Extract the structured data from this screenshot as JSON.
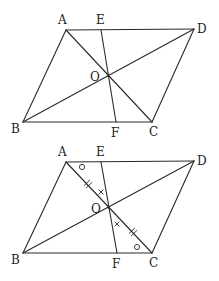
{
  "figures": [
    {
      "id": "figure-1",
      "points": {
        "A": {
          "x": 66,
          "y": 30,
          "label": "A",
          "lx": 58,
          "ly": 24
        },
        "E": {
          "x": 101,
          "y": 30,
          "label": "E",
          "lx": 96,
          "ly": 24
        },
        "D": {
          "x": 194,
          "y": 29,
          "label": "D",
          "lx": 197,
          "ly": 33
        },
        "B": {
          "x": 23,
          "y": 122,
          "label": "B",
          "lx": 11,
          "ly": 133
        },
        "C": {
          "x": 152,
          "y": 122,
          "label": "C",
          "lx": 149,
          "ly": 136
        },
        "F": {
          "x": 116,
          "y": 122,
          "label": "F",
          "lx": 111,
          "ly": 137
        },
        "O": {
          "x": 108,
          "y": 76,
          "label": "O",
          "lx": 90,
          "ly": 81
        }
      },
      "segments": [
        [
          "A",
          "D"
        ],
        [
          "D",
          "C"
        ],
        [
          "C",
          "B"
        ],
        [
          "B",
          "A"
        ],
        [
          "A",
          "C"
        ],
        [
          "B",
          "D"
        ],
        [
          "E",
          "F"
        ]
      ],
      "marks": []
    },
    {
      "id": "figure-2",
      "points": {
        "A": {
          "x": 66,
          "y": 162,
          "label": "A",
          "lx": 58,
          "ly": 156
        },
        "E": {
          "x": 101,
          "y": 162,
          "label": "E",
          "lx": 96,
          "ly": 156
        },
        "D": {
          "x": 194,
          "y": 161,
          "label": "D",
          "lx": 197,
          "ly": 165
        },
        "B": {
          "x": 23,
          "y": 253,
          "label": "B",
          "lx": 11,
          "ly": 264
        },
        "C": {
          "x": 152,
          "y": 253,
          "label": "C",
          "lx": 149,
          "ly": 267
        },
        "F": {
          "x": 117,
          "y": 253,
          "label": "F",
          "lx": 112,
          "ly": 268
        },
        "O": {
          "x": 109,
          "y": 208,
          "label": "O",
          "lx": 91,
          "ly": 213
        }
      },
      "segments": [
        [
          "A",
          "D"
        ],
        [
          "D",
          "C"
        ],
        [
          "C",
          "B"
        ],
        [
          "B",
          "A"
        ],
        [
          "A",
          "C"
        ],
        [
          "B",
          "D"
        ],
        [
          "E",
          "F"
        ]
      ],
      "marks": [
        {
          "type": "circle",
          "meaning": "angle-mark-EAO",
          "x": 82,
          "y": 167
        },
        {
          "type": "double-tick",
          "meaning": "equal-length-AO",
          "x": 88,
          "y": 184
        },
        {
          "type": "cross",
          "meaning": "angle-mark-AOE",
          "x": 101,
          "y": 192
        },
        {
          "type": "cross",
          "meaning": "angle-mark-COF",
          "x": 117,
          "y": 224
        },
        {
          "type": "double-tick",
          "meaning": "equal-length-OC",
          "x": 133,
          "y": 232
        },
        {
          "type": "circle",
          "meaning": "angle-mark-FCO",
          "x": 137,
          "y": 247
        }
      ]
    }
  ],
  "labels": {
    "A": "A",
    "B": "B",
    "C": "C",
    "D": "D",
    "E": "E",
    "F": "F",
    "O": "O"
  },
  "colors": {
    "stroke": "#2a2a2a",
    "text": "#1e1e1e",
    "background": "#ffffff"
  }
}
